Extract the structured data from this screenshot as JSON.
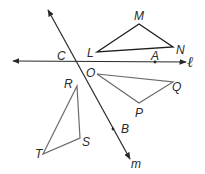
{
  "diagram": {
    "lines": [
      {
        "name": "l",
        "label": "ℓ",
        "from": [
          13,
          61
        ],
        "to": [
          186,
          62
        ],
        "arrows": "both"
      },
      {
        "name": "m",
        "label": "m",
        "from": [
          48,
          10
        ],
        "to": [
          130,
          159
        ],
        "arrows": "both"
      }
    ],
    "points": [
      {
        "label": "C",
        "x": 77,
        "y": 61,
        "label_pos": [
          57,
          60
        ]
      },
      {
        "label": "A",
        "x": 155,
        "y": 62,
        "label_pos": [
          151,
          59
        ]
      },
      {
        "label": "B",
        "x": 113,
        "y": 129,
        "label_pos": [
          121,
          133
        ]
      }
    ],
    "triangles": [
      {
        "name": "LMN",
        "vertices": {
          "L": [
            97,
            52
          ],
          "M": [
            139,
            24
          ],
          "N": [
            173,
            47
          ]
        },
        "color": "#1e1e1e"
      },
      {
        "name": "OPQ",
        "vertices": {
          "O": [
            97,
            74
          ],
          "P": [
            139,
            103
          ],
          "Q": [
            173,
            82
          ]
        },
        "color": "#6a6a6a"
      },
      {
        "name": "RST",
        "vertices": {
          "R": [
            77,
            86
          ],
          "S": [
            80,
            138
          ],
          "T": [
            43,
            154
          ]
        },
        "color": "#6a6a6a"
      }
    ],
    "labels": {
      "M": "M",
      "N": "N",
      "L": "L",
      "A": "A",
      "C": "C",
      "O": "O",
      "Q": "Q",
      "P": "P",
      "R": "R",
      "S": "S",
      "T": "T",
      "B": "B",
      "m": "m",
      "l": "ℓ"
    }
  }
}
